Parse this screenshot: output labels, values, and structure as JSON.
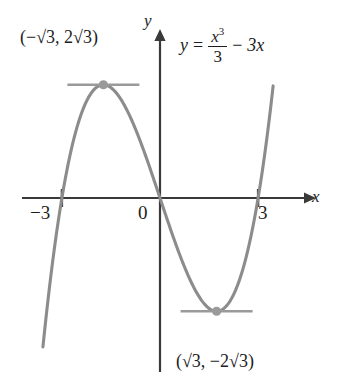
{
  "figure": {
    "kind": "cubic-function-graph",
    "equation_text": "y = x^3/3 - 3x",
    "equation": {
      "lhs": "y",
      "equals": "=",
      "numerator": "x",
      "numerator_exponent": "3",
      "denominator": "3",
      "minus": "−",
      "trailing_term": "3x"
    },
    "axes": {
      "x_label": "x",
      "y_label": "y",
      "origin_label": "0"
    },
    "tick_labels": {
      "x_negative": "−3",
      "x_positive": "3"
    },
    "annotations": {
      "local_max": "(−√3, 2√3)",
      "local_min": "(√3, −2√3)"
    },
    "colors": {
      "curve": "#8c8c8c",
      "axis": "#3a3a3a",
      "tangent": "#9a9a9a",
      "point": "#9a9a9a",
      "text": "#1d1d1d",
      "background": "#ffffff"
    }
  },
  "chart_data": {
    "type": "line",
    "title": "",
    "subtitle": "",
    "xlabel": "x",
    "ylabel": "y",
    "legend": [],
    "grid": false,
    "function": "y = x^3/3 - 3x",
    "xlim": [
      -3.6,
      3.6
    ],
    "ylim": [
      -4.6,
      4.6
    ],
    "x_ticks": [
      -3,
      3
    ],
    "x_tick_labels": [
      "−3",
      "3"
    ],
    "y_ticks": [],
    "y_tick_labels": [],
    "roots": [
      -3,
      0,
      3
    ],
    "series": [
      {
        "name": "y = x^3/3 - 3x",
        "x": [
          -3.62,
          -3.4,
          -3.2,
          -3.0,
          -2.8,
          -2.6,
          -2.4,
          -2.2,
          -2.0,
          -1.8,
          -1.732,
          -1.6,
          -1.4,
          -1.2,
          -1.0,
          -0.8,
          -0.6,
          -0.4,
          -0.2,
          0.0,
          0.2,
          0.4,
          0.6,
          0.8,
          1.0,
          1.2,
          1.4,
          1.6,
          1.732,
          1.8,
          2.0,
          2.2,
          2.4,
          2.6,
          2.8,
          3.0,
          3.2,
          3.4,
          3.45
        ],
        "y": [
          -4.04,
          -2.7,
          -1.53,
          0.0,
          1.08,
          2.94,
          2.59,
          3.05,
          3.33,
          3.46,
          3.464,
          3.43,
          3.29,
          3.02,
          2.67,
          2.23,
          1.73,
          1.18,
          0.59,
          0.0,
          -0.59,
          -1.18,
          -1.73,
          -2.23,
          -2.67,
          -3.02,
          -3.29,
          -3.43,
          -3.464,
          -3.46,
          -3.33,
          -3.05,
          -2.59,
          -1.94,
          -1.08,
          0.0,
          1.53,
          2.7,
          3.05
        ]
      }
    ],
    "annotated_points": [
      {
        "label": "(−√3, 2√3)",
        "x": -1.732,
        "y": 3.464,
        "type": "local maximum",
        "tangent": "horizontal"
      },
      {
        "label": "(√3, −2√3)",
        "x": 1.732,
        "y": -3.464,
        "type": "local minimum",
        "tangent": "horizontal"
      }
    ]
  }
}
